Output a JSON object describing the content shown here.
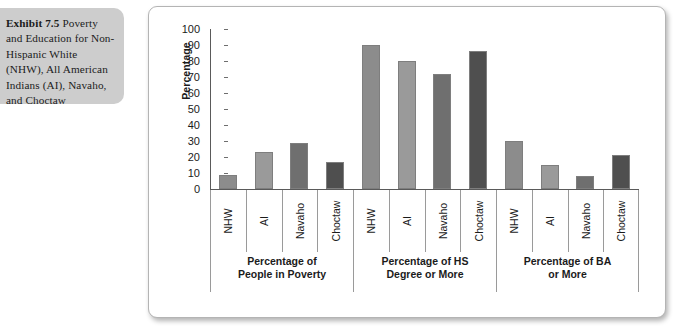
{
  "caption": {
    "lead": "Exhibit 7.5",
    "body": " Poverty and Education for Non-Hispanic White (NHW), All American Indians (AI), Navaho, and Choctaw"
  },
  "chart_data": {
    "type": "bar",
    "title": "",
    "xlabel": "",
    "ylabel": "Percentage",
    "ylim": [
      0,
      100
    ],
    "ytick_step": 10,
    "yticks": [
      100,
      90,
      80,
      70,
      60,
      50,
      40,
      30,
      20,
      10,
      0
    ],
    "grid": false,
    "legend": "none",
    "categories": [
      "NHW",
      "AI",
      "Navaho",
      "Choctaw"
    ],
    "groups": [
      {
        "label": "Percentage of\nPeople in Poverty",
        "label_line1": "Percentage of",
        "label_line2": "People in Poverty",
        "values": [
          9,
          23,
          29,
          17
        ]
      },
      {
        "label": "Percentage of HS\nDegree or More",
        "label_line1": "Percentage of HS",
        "label_line2": "Degree or More",
        "values": [
          90,
          80,
          72,
          86
        ]
      },
      {
        "label": "Percentage of BA\nor More",
        "label_line1": "Percentage of BA",
        "label_line2": "or More",
        "values": [
          30,
          15,
          8,
          21
        ]
      }
    ],
    "series_colors": [
      "#8c8c8c",
      "#9a9a9a",
      "#6f6f6f",
      "#4f4f4f"
    ],
    "bar_border_color": "#7e7e7e"
  },
  "colors": {
    "caption_background": "#cdcdcd",
    "frame_border": "#b4b4b4",
    "axis": "#5a5a5a",
    "text": "#1b1b1b"
  }
}
